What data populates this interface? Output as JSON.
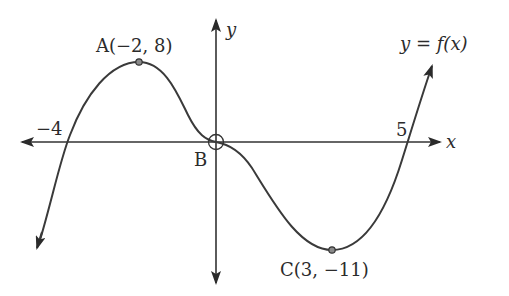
{
  "figure": {
    "curve_label": "y = f(x)",
    "axes": {
      "x_label": "x",
      "y_label": "y"
    },
    "intercept_labels": {
      "left": "−4",
      "right": "5"
    },
    "points": [
      {
        "name": "A",
        "label": "A(−2, 8)",
        "x": -2,
        "y": 8,
        "kind": "local maximum"
      },
      {
        "name": "B",
        "label": "B",
        "x": 0,
        "y": 0,
        "kind": "stationary point of inflection"
      },
      {
        "name": "C",
        "label": "C(3, −11)",
        "x": 3,
        "y": -11,
        "kind": "local minimum"
      }
    ],
    "x_intercepts": [
      -4,
      0,
      5
    ],
    "colors": {
      "line": "#333333",
      "point_fill": "#8a8a8a",
      "background": "#ffffff"
    }
  }
}
